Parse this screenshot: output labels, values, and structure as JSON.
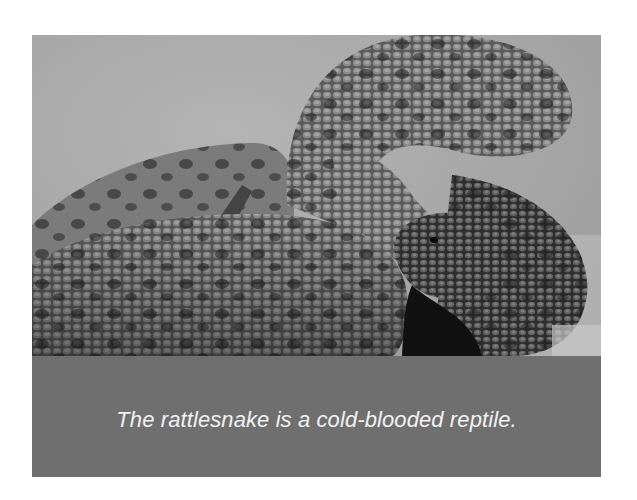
{
  "image": {
    "subject": "rattlesnake",
    "alt": "Close-up grayscale photograph of a coiled rattlesnake"
  },
  "caption": {
    "text": "The rattlesnake is a cold-blooded reptile."
  },
  "colors": {
    "caption_background": "#6f6f6f",
    "caption_text": "#f2f2f2",
    "page_background": "#ffffff"
  }
}
